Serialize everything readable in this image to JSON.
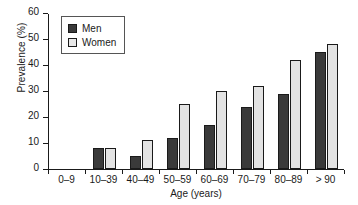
{
  "chart_data": {
    "type": "bar",
    "title": "",
    "xlabel": "Age (years)",
    "ylabel": "Prevalence (%)",
    "categories": [
      "0–9",
      "10–39",
      "40–49",
      "50–59",
      "60–69",
      "70–79",
      "80–89",
      "> 90"
    ],
    "series": [
      {
        "name": "Men",
        "color": "#3a3a3a",
        "values": [
          0,
          8,
          5,
          12,
          17,
          24,
          29,
          45
        ]
      },
      {
        "name": "Women",
        "color": "#e3e3e3",
        "values": [
          0,
          8,
          11,
          25,
          30,
          32,
          42,
          48
        ]
      }
    ],
    "ylim": [
      0,
      60
    ],
    "yticks": [
      0,
      10,
      20,
      30,
      40,
      50,
      60
    ],
    "ytick_labels": [
      "0",
      "10",
      "20",
      "30",
      "40",
      "50",
      "60"
    ],
    "grid": false,
    "legend_position": "upper-left",
    "legend_entries": [
      "Men",
      "Women"
    ]
  }
}
